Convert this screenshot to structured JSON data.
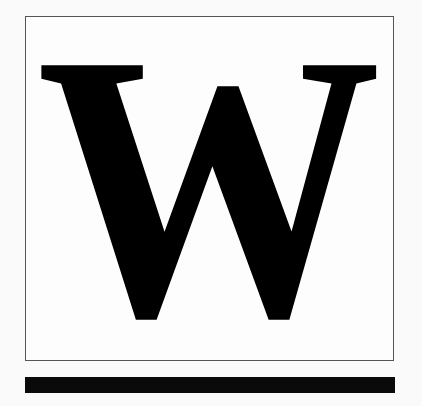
{
  "logo": {
    "letter": "W",
    "color": "#000000",
    "frame_color": "#555555",
    "bar_color": "#0a0a0a"
  }
}
